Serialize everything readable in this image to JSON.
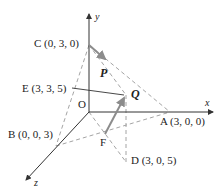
{
  "diagram": {
    "axes": {
      "x_label": "x",
      "y_label": "y",
      "z_label": "z",
      "origin_label": "O"
    },
    "points": {
      "A": "A (3, 0, 0)",
      "B": "B (0, 0, 3)",
      "C": "C (0, 3, 0)",
      "D": "D (3, 0, 5)",
      "E": "E (3, 3, 5)",
      "F": "F"
    },
    "vectors": {
      "P": "P",
      "Q": "Q"
    },
    "colors": {
      "axis": "#333333",
      "dashed": "#9a9a9a",
      "vector": "#8c8c8c",
      "text": "#222222"
    }
  }
}
